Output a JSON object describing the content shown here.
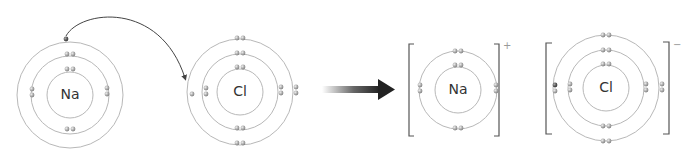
{
  "diagram": {
    "colors": {
      "shell": "#b8b8b8",
      "electron_fill": "#9a9a9a",
      "electron_highlight": "#e0e0e0",
      "transferred_electron": "#555555",
      "arrow": "#222222",
      "bracket": "#555555",
      "text": "#333333"
    },
    "atoms": [
      {
        "id": "na-atom",
        "symbol": "Na",
        "shells": [
          2,
          8,
          1
        ],
        "description": "Sodium atom with outer electron transferring"
      },
      {
        "id": "cl-atom",
        "symbol": "Cl",
        "shells": [
          2,
          8,
          7
        ],
        "description": "Chlorine atom receiving electron"
      }
    ],
    "ions": [
      {
        "id": "na-ion",
        "symbol": "Na",
        "charge": "+",
        "shells": [
          2,
          8
        ]
      },
      {
        "id": "cl-ion",
        "symbol": "Cl",
        "charge": "−",
        "shells": [
          2,
          8,
          8
        ]
      }
    ],
    "transfer_arrow": "curved arrow from Na outer electron to Cl outer shell",
    "reaction_arrow": "right-arrow"
  }
}
